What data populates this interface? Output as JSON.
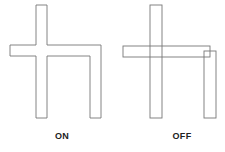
{
  "figures": [
    {
      "id": "on",
      "label": "ON",
      "label_pos": {
        "x": 62,
        "y": 131
      },
      "shape": "union",
      "stroke": "#777777",
      "vertical_bar": {
        "x": 36,
        "y": 5,
        "w": 11,
        "h": 113
      },
      "horizontal_bar": {
        "x": 10,
        "y": 45,
        "w": 91,
        "h": 11
      },
      "right_leg": {
        "x": 90,
        "y": 45,
        "w": 11,
        "h": 73
      }
    },
    {
      "id": "off",
      "label": "OFF",
      "label_pos": {
        "x": 182,
        "y": 131
      },
      "shape": "overlapping-rectangles",
      "stroke": "#777777",
      "vertical_bar": {
        "x": 150,
        "y": 5,
        "w": 12,
        "h": 113
      },
      "horizontal_bar": {
        "x": 123,
        "y": 46,
        "w": 87,
        "h": 11
      },
      "right_leg": {
        "x": 204,
        "y": 51,
        "w": 12,
        "h": 67
      }
    }
  ]
}
